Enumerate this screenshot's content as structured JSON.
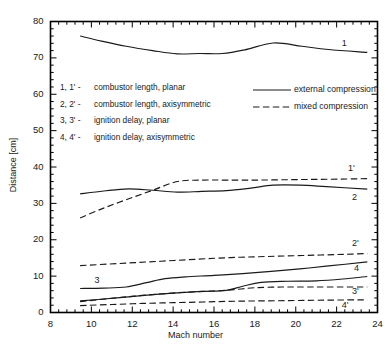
{
  "chart_data": {
    "type": "line",
    "title": "",
    "xlabel": "Mach number",
    "ylabel": "Distance [cm]",
    "xlim": [
      8,
      24
    ],
    "ylim": [
      0,
      80
    ],
    "xticks": [
      8,
      10,
      12,
      14,
      16,
      18,
      20,
      22,
      24
    ],
    "yticks": [
      0,
      10,
      20,
      30,
      40,
      50,
      60,
      70,
      80
    ],
    "x_minor_step": 0.4,
    "y_minor_step": 2,
    "grid": false,
    "legend_position": "upper-right-inside",
    "series": [
      {
        "name": "1",
        "tag": "1",
        "style": "external compression",
        "dash": "solid",
        "description": "combustor length, planar",
        "x": [
          9.45,
          10.5,
          11.7,
          13.0,
          14.2,
          15.3,
          16.4,
          17.5,
          18.9,
          20.3,
          21.6,
          23.5
        ],
        "y": [
          76.0,
          74.6,
          73.2,
          72.0,
          71.1,
          71.2,
          71.2,
          72.2,
          74.1,
          73.2,
          72.3,
          71.5
        ]
      },
      {
        "name": "2",
        "tag": "2",
        "style": "external compression",
        "dash": "solid",
        "description": "combustor length, axisymmetric",
        "x": [
          9.45,
          10.6,
          11.8,
          13.0,
          14.2,
          15.4,
          16.6,
          17.8,
          18.9,
          20.2,
          21.5,
          23.5
        ],
        "y": [
          32.6,
          33.4,
          34.0,
          33.6,
          33.1,
          33.3,
          33.5,
          34.2,
          35.0,
          35.0,
          34.6,
          33.9
        ]
      },
      {
        "name": "1'",
        "tag": "1'",
        "style": "mixed compression",
        "dash": "dashed",
        "description": "combustor length, planar",
        "x": [
          9.45,
          10.6,
          11.8,
          13.0,
          14.2,
          15.4,
          16.6,
          18.0,
          19.5,
          21.0,
          22.5,
          23.5
        ],
        "y": [
          26.0,
          28.7,
          31.2,
          33.6,
          36.0,
          36.4,
          36.4,
          36.4,
          36.5,
          36.6,
          36.7,
          36.8
        ]
      },
      {
        "name": "2'",
        "tag": "2'",
        "style": "mixed compression",
        "dash": "dashed",
        "description": "combustor length, axisymmetric",
        "x": [
          9.45,
          10.8,
          12.1,
          13.4,
          14.7,
          16.0,
          17.3,
          18.6,
          19.9,
          21.2,
          22.4,
          23.5
        ],
        "y": [
          12.9,
          13.3,
          13.7,
          14.1,
          14.5,
          14.9,
          15.2,
          15.4,
          15.6,
          15.8,
          16.0,
          16.2
        ]
      },
      {
        "name": "3",
        "tag": "3",
        "style": "external compression",
        "dash": "solid",
        "description": "ignition delay, planar",
        "x": [
          9.45,
          10.6,
          11.7,
          12.7,
          13.6,
          14.6,
          16.0,
          17.4,
          18.8,
          20.2,
          21.6,
          23.5
        ],
        "y": [
          6.6,
          6.7,
          7.0,
          8.2,
          9.3,
          9.8,
          10.2,
          10.7,
          11.3,
          12.0,
          12.8,
          13.9
        ]
      },
      {
        "name": "4",
        "tag": "4",
        "style": "external compression",
        "dash": "solid",
        "description": "ignition delay, axisymmetric",
        "x": [
          9.45,
          10.6,
          11.8,
          13.0,
          14.2,
          15.4,
          16.6,
          17.4,
          18.3,
          19.6,
          21.0,
          22.3,
          23.5
        ],
        "y": [
          3.2,
          3.7,
          4.3,
          4.9,
          5.4,
          5.8,
          6.1,
          7.2,
          8.3,
          8.6,
          8.7,
          9.2,
          9.9
        ]
      },
      {
        "name": "3'",
        "tag": "3'",
        "style": "mixed compression",
        "dash": "dashed",
        "description": "ignition delay, planar",
        "x": [
          9.45,
          10.8,
          12.1,
          13.4,
          14.7,
          16.0,
          17.0,
          18.0,
          19.3,
          20.6,
          22.0,
          23.5
        ],
        "y": [
          3.0,
          3.8,
          4.5,
          5.1,
          5.6,
          5.9,
          6.3,
          6.8,
          7.0,
          7.0,
          7.0,
          7.0
        ]
      },
      {
        "name": "4'",
        "tag": "4'",
        "style": "mixed compression",
        "dash": "dashed",
        "description": "ignition delay, axisymmetric",
        "x": [
          9.45,
          11.0,
          12.5,
          14.0,
          15.5,
          17.0,
          18.5,
          20.0,
          21.5,
          23.5
        ],
        "y": [
          1.9,
          2.2,
          2.5,
          2.7,
          2.9,
          3.1,
          3.2,
          3.3,
          3.4,
          3.5
        ]
      }
    ],
    "notes": [
      {
        "key": "1, 1' -",
        "text": "combustor length, planar"
      },
      {
        "key": "2, 2' -",
        "text": "combustor length, axisymmetric"
      },
      {
        "key": "3, 3' -",
        "text": "ignition delay, planar"
      },
      {
        "key": "4, 4' -",
        "text": "ignition delay, axisymmetric"
      }
    ],
    "legend": [
      {
        "label": "external compression",
        "dash": "solid"
      },
      {
        "label": "mixed compression",
        "dash": "dashed"
      }
    ],
    "curve_tags": [
      {
        "tag": "1",
        "x": 22.4,
        "y": 73.6
      },
      {
        "tag": "1'",
        "x": 22.7,
        "y": 39.4
      },
      {
        "tag": "2",
        "x": 22.9,
        "y": 31.3
      },
      {
        "tag": "2'",
        "x": 22.9,
        "y": 18.6
      },
      {
        "tag": "4",
        "x": 23.0,
        "y": 11.8
      },
      {
        "tag": "3'",
        "x": 22.9,
        "y": 5.4
      },
      {
        "tag": "4'",
        "x": 22.4,
        "y": 1.6
      },
      {
        "tag": "3",
        "x": 10.3,
        "y": 8.6
      }
    ],
    "colors": {
      "line": "#1a1a1a",
      "axis": "#000000",
      "background": "#ffffff"
    }
  }
}
